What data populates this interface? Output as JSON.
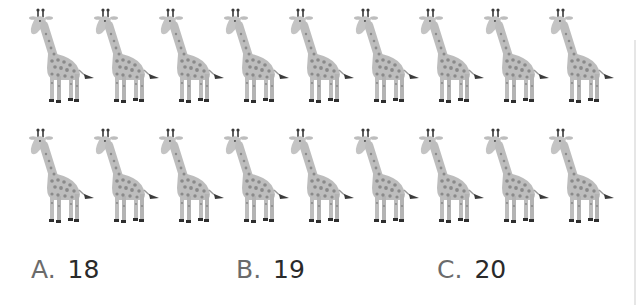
{
  "question": {
    "rows": [
      {
        "name": "row-1",
        "count": 9,
        "item": "giraffe"
      },
      {
        "name": "row-2",
        "count": 9,
        "item": "giraffe"
      }
    ],
    "choices": [
      {
        "letter": "A.",
        "value": "18"
      },
      {
        "letter": "B.",
        "value": "19"
      },
      {
        "letter": "C.",
        "value": "20"
      }
    ]
  },
  "colors": {
    "giraffe_body": "#bdbdbd",
    "giraffe_spots": "#8a8a8a",
    "giraffe_dark": "#3a3a3a",
    "letter": "#6b6b6b",
    "value": "#2a2a2a"
  }
}
